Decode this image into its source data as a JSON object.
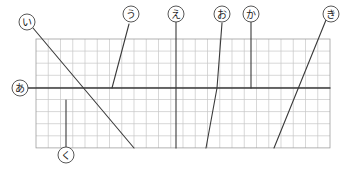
{
  "diagram": {
    "background": "#ffffff",
    "ink_color": "#3a3a3a",
    "grid": {
      "x": 36,
      "y": 39,
      "cols": 24,
      "rows": 9,
      "cell_w": 12.25,
      "cell_h": 12.1,
      "line_color": "#c7c7c7",
      "border_color": "#9e9e9e"
    },
    "circle_radius": 8,
    "circle_stroke": "#444444",
    "labels": [
      {
        "id": "i",
        "char": "い",
        "cx": 27,
        "cy": 22
      },
      {
        "id": "u",
        "char": "う",
        "cx": 131,
        "cy": 14
      },
      {
        "id": "e",
        "char": "え",
        "cx": 176,
        "cy": 14
      },
      {
        "id": "o",
        "char": "お",
        "cx": 222,
        "cy": 14
      },
      {
        "id": "ka",
        "char": "か",
        "cx": 251,
        "cy": 14
      },
      {
        "id": "ki",
        "char": "き",
        "cx": 331,
        "cy": 14
      },
      {
        "id": "a",
        "char": "あ",
        "cx": 20,
        "cy": 88
      },
      {
        "id": "ku",
        "char": "く",
        "cx": 66,
        "cy": 155
      }
    ],
    "segments": [
      {
        "id": "a",
        "points": [
          [
            28,
            88
          ],
          [
            330,
            88
          ]
        ],
        "width": 1.4
      },
      {
        "id": "i",
        "points": [
          [
            33,
            28
          ],
          [
            134,
            148
          ]
        ],
        "width": 1.1
      },
      {
        "id": "u",
        "points": [
          [
            129,
            24
          ],
          [
            112,
            88
          ]
        ],
        "width": 1.1
      },
      {
        "id": "e",
        "points": [
          [
            176,
            22
          ],
          [
            176,
            148
          ]
        ],
        "width": 1.1
      },
      {
        "id": "o",
        "points": [
          [
            222,
            23
          ],
          [
            217,
            88
          ],
          [
            206,
            148
          ]
        ],
        "width": 1.1
      },
      {
        "id": "ka",
        "points": [
          [
            251,
            22
          ],
          [
            251,
            88
          ]
        ],
        "width": 1.1
      },
      {
        "id": "ki",
        "points": [
          [
            326,
            20
          ],
          [
            274,
            148
          ]
        ],
        "width": 1.1
      },
      {
        "id": "ku",
        "points": [
          [
            66,
            100
          ],
          [
            66,
            147
          ]
        ],
        "width": 1.1
      }
    ]
  }
}
